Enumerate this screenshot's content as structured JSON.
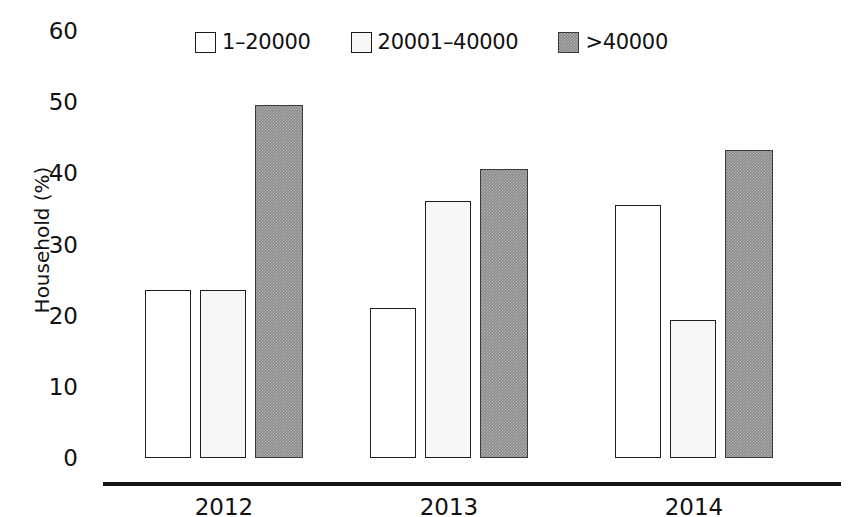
{
  "chart_data": {
    "type": "bar",
    "title": "",
    "xlabel": "",
    "ylabel": "Household (%)",
    "categories": [
      "2012",
      "2013",
      "2014"
    ],
    "ylim": [
      0,
      60
    ],
    "yticks": [
      "0",
      "10",
      "20",
      "30",
      "40",
      "50",
      "60"
    ],
    "grid": false,
    "legend_position": "top",
    "series": [
      {
        "name": "1–20000",
        "swatch": "#ffffff",
        "values": [
          23.5,
          21.0,
          35.5
        ]
      },
      {
        "name": "20001–40000",
        "swatch": "#f7f7f5",
        "values": [
          23.6,
          36.0,
          19.3
        ]
      },
      {
        "name": ">40000",
        "swatch": "#8a8a8a",
        "values": [
          49.5,
          40.5,
          43.2
        ]
      }
    ]
  },
  "colors": {
    "axis": "#151515",
    "text": "#111111",
    "series_1_fill": "#ffffff",
    "series_2_fill": "#f7f7f5",
    "series_3_fill": "#8a8a8a",
    "bar_stroke": "#1f1f1f"
  }
}
